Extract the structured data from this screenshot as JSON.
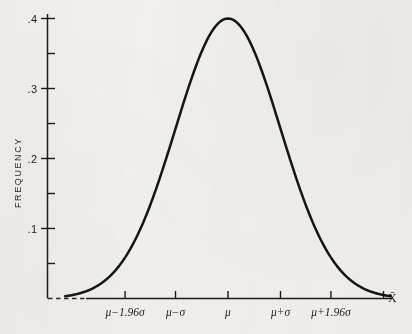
{
  "figure": {
    "background_color": "#f2f1ee",
    "ink_color": "#151515",
    "axis_title_y": "FREQUENCY",
    "axis_end_label_x": "X̄"
  },
  "chart_data": {
    "type": "line",
    "title": "",
    "subtitle": "",
    "xlabel": "",
    "ylabel": "FREQUENCY",
    "grid": false,
    "legend": "none",
    "annotations": [
      {
        "text": "X̄",
        "role": "x-axis-end-label"
      }
    ],
    "y_axis": {
      "range": [
        0.0,
        0.42
      ],
      "major_ticks": [
        0.1,
        0.2,
        0.3,
        0.4
      ],
      "major_tick_labels": [
        ".1",
        ".2",
        ".3",
        ".4"
      ],
      "minor_ticks": [
        0.05,
        0.15,
        0.25,
        0.35
      ]
    },
    "x_axis": {
      "tick_labels": [
        "μ−1.96σ",
        "μ−σ",
        "μ",
        "μ+σ",
        "μ+1.96σ"
      ],
      "tick_values_in_sigma": [
        -1.96,
        -1.0,
        0.0,
        1.0,
        1.96
      ],
      "range_in_sigma": [
        -3.1,
        3.1
      ]
    },
    "series": [
      {
        "name": "standard normal density",
        "formula": "y = 0.3989 * exp(-z^2 / 2)",
        "x": [
          -3.1,
          -2.8,
          -2.5,
          -2.2,
          -1.96,
          -1.7,
          -1.4,
          -1.1,
          -0.8,
          -0.5,
          -0.25,
          0.0,
          0.25,
          0.5,
          0.8,
          1.1,
          1.4,
          1.7,
          1.96,
          2.2,
          2.5,
          2.8,
          3.1
        ],
        "values": [
          0.003,
          0.008,
          0.018,
          0.035,
          0.058,
          0.094,
          0.15,
          0.218,
          0.29,
          0.352,
          0.387,
          0.399,
          0.387,
          0.352,
          0.29,
          0.218,
          0.15,
          0.094,
          0.058,
          0.035,
          0.018,
          0.008,
          0.003
        ],
        "peak": {
          "x_label": "μ",
          "y": 0.4
        }
      }
    ]
  },
  "y_ticks": [
    {
      "label": ".4",
      "value": 0.4
    },
    {
      "label": ".3",
      "value": 0.3
    },
    {
      "label": ".2",
      "value": 0.2
    },
    {
      "label": ".1",
      "value": 0.1
    }
  ],
  "x_ticks": [
    {
      "label": "μ−1.96σ",
      "value": -1.96
    },
    {
      "label": "μ−σ",
      "value": -1.0
    },
    {
      "label": "μ",
      "value": 0.0
    },
    {
      "label": "μ+σ",
      "value": 1.0
    },
    {
      "label": "μ+1.96σ",
      "value": 1.96
    }
  ]
}
